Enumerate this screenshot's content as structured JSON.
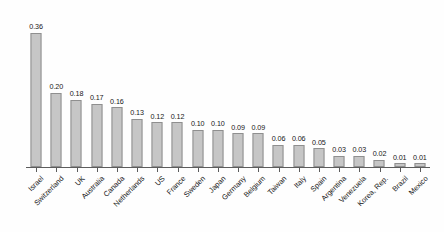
{
  "chart_data": {
    "type": "bar",
    "title": "",
    "subtitle": "",
    "xlabel": "",
    "ylabel": "",
    "ylim": [
      0,
      0.4
    ],
    "grid": false,
    "legend": "none",
    "orientation": "vertical",
    "sorted": "descending",
    "label_rotation_deg": -45,
    "value_label_format": "0.00",
    "categories": [
      "Israel",
      "Switzerland",
      "UK",
      "Australia",
      "Canada",
      "Netherlands",
      "US",
      "France",
      "Sweden",
      "Japan",
      "Germany",
      "Belgium",
      "Taiwan",
      "Italy",
      "Spain",
      "Argentina",
      "Venezuela",
      "Korea, Rep.",
      "Brazil",
      "Mexico"
    ],
    "values": [
      0.36,
      0.2,
      0.18,
      0.17,
      0.16,
      0.13,
      0.12,
      0.12,
      0.1,
      0.1,
      0.09,
      0.09,
      0.06,
      0.06,
      0.05,
      0.03,
      0.03,
      0.02,
      0.01,
      0.01
    ],
    "value_labels": [
      "0.36",
      "0.20",
      "0.18",
      "0.17",
      "0.16",
      "0.13",
      "0.12",
      "0.12",
      "0.10",
      "0.10",
      "0.09",
      "0.09",
      "0.06",
      "0.06",
      "0.05",
      "0.03",
      "0.03",
      "0.02",
      "0.01",
      "0.01"
    ]
  },
  "style": {
    "bar_fill": "#c6c6c6",
    "bar_border": "#8f8f8f",
    "axis_color": "#5c5c5c",
    "text_color": "#171717",
    "background": "#fefefe"
  }
}
